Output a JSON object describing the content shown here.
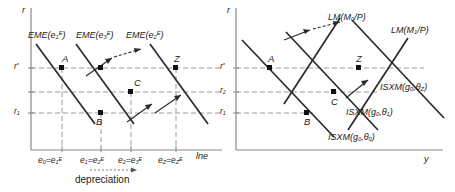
{
  "figure": {
    "type": "economics-diagram",
    "panels": 2
  },
  "left_panel": {
    "vertical_axis_label": "r",
    "horizontal_axis_label": "lne",
    "y_ticks": [
      "r*",
      "r₁"
    ],
    "y_tick_parts": [
      {
        "base": "r",
        "sup": "*"
      },
      {
        "base": "r",
        "sub": "1"
      }
    ],
    "x_ticks": [
      {
        "text": "e₀=e₁ᴱ",
        "left": "e",
        "left_sub": "0",
        "right": "e",
        "right_sub": "1",
        "right_sup": "E"
      },
      {
        "text": "e₁=e₂ᴱ",
        "left": "e",
        "left_sub": "1",
        "right": "e",
        "right_sub": "2",
        "right_sup": "E"
      },
      {
        "text": "e₂=e₃ᴱ",
        "left": "e",
        "left_sub": "2",
        "right": "e",
        "right_sub": "3",
        "right_sup": "E"
      },
      {
        "text": "e_Z=e_Zᴱ",
        "left": "e",
        "left_sub": "Z",
        "right": "e",
        "right_sub": "Z",
        "right_sup": "E"
      }
    ],
    "curves": [
      {
        "name": "EME",
        "arg_base": "e",
        "arg_sub": "1",
        "arg_sup": "E",
        "label": "EME(e₁ᴱ)"
      },
      {
        "name": "EME",
        "arg_base": "e",
        "arg_sub": "3",
        "arg_sup": "E",
        "label": "EME(e₃ᴱ)"
      },
      {
        "name": "EME",
        "arg_base": "e",
        "arg_sub": "2",
        "arg_sup": "E",
        "label": "EME(e₂ᴱ)"
      }
    ],
    "points": [
      "A",
      "C",
      "B",
      "Z"
    ],
    "annotation": "depreciation"
  },
  "right_panel": {
    "vertical_axis_label": "r",
    "horizontal_axis_label": "y",
    "y_ticks": [
      "r*",
      "r₂",
      "r₁"
    ],
    "y_tick_parts": [
      {
        "base": "r",
        "sup": "*"
      },
      {
        "base": "r",
        "sub": "2"
      },
      {
        "base": "r",
        "sub": "1"
      }
    ],
    "curves": [
      {
        "name": "LM",
        "arg": "M₀/P",
        "base": "M",
        "sub": "0",
        "tail": "/P",
        "label": "LM(M₀/P)"
      },
      {
        "name": "LM",
        "arg": "M₁/P",
        "base": "M",
        "sub": "1",
        "tail": "/P",
        "label": "LM(M₁/P)"
      },
      {
        "name": "ISXM",
        "arg": "g₀,θ_Z",
        "base": "g",
        "sub": "0",
        "theta_sub": "Z",
        "label": "ISXM(g₀,θ₂)"
      },
      {
        "name": "ISXM",
        "arg": "g₀,θ₁",
        "base": "g",
        "sub": "0",
        "theta_sub": "1",
        "label": "ISXM(g₀,θ₁)"
      },
      {
        "name": "ISXM",
        "arg": "g₀,θ₀",
        "base": "g",
        "sub": "0",
        "theta_sub": "0",
        "label": "ISXM(g₀,θ₀)"
      }
    ],
    "points": [
      "A",
      "Z",
      "C",
      "B"
    ]
  },
  "colors": {
    "ink": "#1a1a1a",
    "axis": "#8a8a8a",
    "dashed": "#9a9a9a",
    "curve": "#2b2b2b"
  }
}
